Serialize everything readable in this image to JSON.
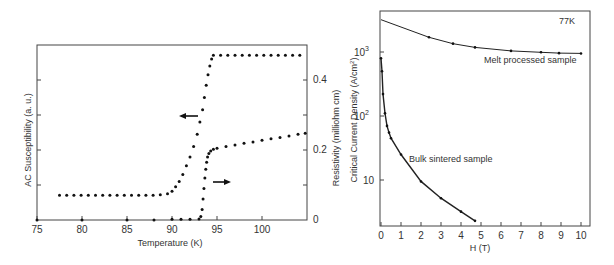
{
  "chart_data": [
    {
      "type": "scatter",
      "title": "",
      "xlabel": "Temperature (K)",
      "ylabel": "AC Susceptibility (a. u.)",
      "ylabel_right": "Resistivity (milliohm cm)",
      "xlim": [
        75,
        105
      ],
      "ylim_right": [
        0,
        0.5
      ],
      "xticks": [
        "75",
        "80",
        "85",
        "90",
        "95",
        "100"
      ],
      "yticks_right": [
        "0",
        "0.2",
        "0.4"
      ],
      "grid": false,
      "annotations": [
        {
          "text": "arrow-left",
          "meaning": "susceptibility curve uses left axis",
          "x": 93,
          "y": 0.36
        },
        {
          "text": "arrow-right",
          "meaning": "resistivity curve uses right axis",
          "x": 95.5,
          "y": 0.09
        }
      ],
      "series": [
        {
          "name": "AC Susceptibility",
          "axis": "left",
          "x": [
            77.5,
            78.3,
            79.1,
            79.9,
            80.7,
            81.5,
            82.3,
            83.1,
            83.9,
            84.7,
            85.5,
            86.3,
            87.1,
            87.9,
            88.7,
            89.5,
            90.0,
            90.4,
            90.8,
            91.2,
            91.6,
            92.0,
            92.4,
            92.8,
            93.1,
            93.4,
            93.6,
            93.8,
            94.0,
            94.2,
            94.4,
            94.6,
            95.4,
            96.2,
            97.0,
            97.8,
            98.6,
            99.4,
            100.2,
            101.0,
            101.8,
            102.6,
            103.4,
            104.2
          ],
          "y": [
            0.071,
            0.071,
            0.071,
            0.071,
            0.071,
            0.071,
            0.071,
            0.071,
            0.071,
            0.071,
            0.071,
            0.071,
            0.071,
            0.071,
            0.072,
            0.075,
            0.082,
            0.095,
            0.11,
            0.13,
            0.155,
            0.18,
            0.21,
            0.245,
            0.28,
            0.315,
            0.35,
            0.385,
            0.415,
            0.44,
            0.46,
            0.471,
            0.471,
            0.471,
            0.471,
            0.471,
            0.471,
            0.471,
            0.471,
            0.471,
            0.471,
            0.471,
            0.471,
            0.471
          ]
        },
        {
          "name": "Resistivity",
          "axis": "right",
          "x": [
            75,
            80,
            85,
            88,
            90,
            91,
            92,
            93,
            93.2,
            93.35,
            93.45,
            93.55,
            93.65,
            93.75,
            93.85,
            93.95,
            94.1,
            94.3,
            94.6,
            95,
            96,
            97,
            98,
            99,
            100,
            101,
            102,
            103,
            104,
            104.8
          ],
          "y": [
            0,
            0,
            0,
            0,
            0.002,
            0.002,
            0.002,
            0.003,
            0.01,
            0.03,
            0.06,
            0.09,
            0.12,
            0.145,
            0.165,
            0.18,
            0.19,
            0.197,
            0.202,
            0.205,
            0.21,
            0.214,
            0.219,
            0.223,
            0.228,
            0.232,
            0.236,
            0.24,
            0.245,
            0.248
          ]
        }
      ]
    },
    {
      "type": "line",
      "title": "",
      "annotation_top_right": "77K",
      "xlabel": "H (T)",
      "ylabel": "Critical Current Density (A/cm²)",
      "xlim": [
        0,
        10.5
      ],
      "ylim": [
        1.9,
        4400
      ],
      "yscale": "log",
      "xticks": [
        "0",
        "1",
        "2",
        "3",
        "4",
        "5",
        "6",
        "7",
        "8",
        "9",
        "10"
      ],
      "yticks": [
        "10",
        "10²",
        "10³"
      ],
      "grid": false,
      "series": [
        {
          "name": "Melt processed sample",
          "x": [
            0,
            2.4,
            3.6,
            4.7,
            6.5,
            8,
            8.9,
            10
          ],
          "y": [
            3200,
            1700,
            1350,
            1180,
            1040,
            990,
            960,
            950
          ]
        },
        {
          "name": "Bulk sintered sample",
          "x": [
            0,
            0.05,
            0.1,
            0.2,
            0.3,
            0.4,
            0.5,
            1,
            2,
            3,
            4,
            4.7
          ],
          "y": [
            800,
            500,
            220,
            110,
            70,
            55,
            45,
            25,
            9.5,
            5.2,
            3.2,
            2.3
          ]
        }
      ]
    }
  ],
  "left_chart": {
    "xlabel": "Temperature (K)",
    "ylabel_left": "AC Susceptibility (a. u.)",
    "ylabel_right": "Resistivity (milliohm cm)",
    "xticks": [
      "75",
      "80",
      "85",
      "90",
      "95",
      "100"
    ],
    "yticks_right": [
      "0",
      "0.2",
      "0.4"
    ]
  },
  "right_chart": {
    "xlabel": "H (T)",
    "ylabel": "Critical Current Density (A/cm",
    "ylabel_sup": "2",
    "ylabel_end": ")",
    "temp_label": "77K",
    "series1_label": "Melt processed sample",
    "series2_label": "Bulk sintered sample",
    "xticks": [
      "0",
      "1",
      "2",
      "3",
      "4",
      "5",
      "6",
      "7",
      "8",
      "9",
      "10"
    ],
    "ytick_10": "10",
    "ytick_base": "10",
    "ytick_sup2": "2",
    "ytick_sup3": "3"
  }
}
